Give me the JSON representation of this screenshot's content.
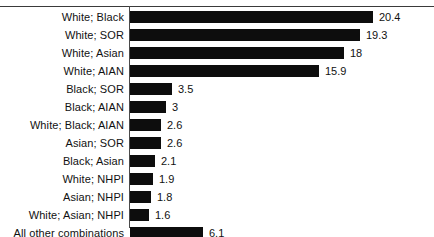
{
  "chart_data": {
    "type": "bar",
    "orientation": "horizontal",
    "title": "",
    "subtitle": "",
    "xlabel": "",
    "ylabel": "",
    "grid": false,
    "legend": false,
    "legend_position": "none",
    "axis_line": true,
    "top_rule": true,
    "xlim": [
      0,
      20.4
    ],
    "bar_color": "#0d0d0d",
    "categories": [
      "White; Black",
      "White; SOR",
      "White; Asian",
      "White; AIAN",
      "Black; SOR",
      "Black; AIAN",
      "White; Black; AIAN",
      "Asian; SOR",
      "Black; Asian",
      "White; NHPI",
      "Asian; NHPI",
      "White; Asian; NHPI",
      "All other combinations"
    ],
    "values": [
      20.4,
      19.3,
      18,
      15.9,
      3.5,
      3,
      2.6,
      2.6,
      2.1,
      1.9,
      1.8,
      1.6,
      6.1
    ],
    "value_labels": [
      "20.4",
      "19.3",
      "18",
      "15.9",
      "3.5",
      "3",
      "2.6",
      "2.6",
      "2.1",
      "1.9",
      "1.8",
      "1.6",
      "6.1"
    ],
    "bars": [
      {
        "category": "White; Black",
        "value": 20.4,
        "label": "20.4"
      },
      {
        "category": "White; SOR",
        "value": 19.3,
        "label": "19.3"
      },
      {
        "category": "White; Asian",
        "value": 18,
        "label": "18"
      },
      {
        "category": "White; AIAN",
        "value": 15.9,
        "label": "15.9"
      },
      {
        "category": "Black; SOR",
        "value": 3.5,
        "label": "3.5"
      },
      {
        "category": "Black; AIAN",
        "value": 3,
        "label": "3"
      },
      {
        "category": "White; Black; AIAN",
        "value": 2.6,
        "label": "2.6"
      },
      {
        "category": "Asian; SOR",
        "value": 2.6,
        "label": "2.6"
      },
      {
        "category": "Black; Asian",
        "value": 2.1,
        "label": "2.1"
      },
      {
        "category": "White; NHPI",
        "value": 1.9,
        "label": "1.9"
      },
      {
        "category": "Asian; NHPI",
        "value": 1.8,
        "label": "1.8"
      },
      {
        "category": "White; Asian; NHPI",
        "value": 1.6,
        "label": "1.6"
      },
      {
        "category": "All other combinations",
        "value": 6.1,
        "label": "6.1"
      }
    ]
  }
}
